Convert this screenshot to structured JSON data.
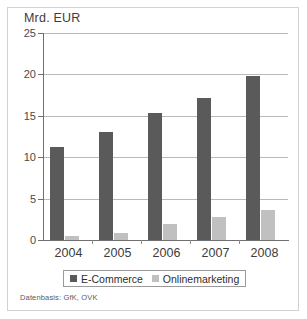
{
  "chart_data": {
    "type": "bar",
    "title": "Mrd. EUR",
    "xlabel": "",
    "ylabel": "Mrd. EUR",
    "categories": [
      "2004",
      "2005",
      "2006",
      "2007",
      "2008"
    ],
    "series": [
      {
        "name": "E-Commerce",
        "color": "#5a5a5a",
        "values": [
          11.2,
          13.0,
          15.3,
          17.2,
          19.8
        ]
      },
      {
        "name": "Onlinemarketing",
        "color": "#c0c0c0",
        "values": [
          0.5,
          0.9,
          1.9,
          2.8,
          3.6
        ]
      }
    ],
    "ylim": [
      0,
      25
    ],
    "yticks": [
      0,
      5,
      10,
      15,
      20,
      25
    ],
    "ytick_labels": [
      "0",
      "5",
      "10",
      "15",
      "20",
      "25"
    ],
    "grid": true,
    "legend_position": "bottom"
  },
  "footnote": "Datenbasis: GfK, OVK",
  "colors": {
    "e_commerce": "#5a5a5a",
    "onlinemarketing": "#c0c0c0",
    "gridline": "#b9b9b9",
    "axis": "#6f6f6f",
    "frame": "#d2d2d2"
  }
}
